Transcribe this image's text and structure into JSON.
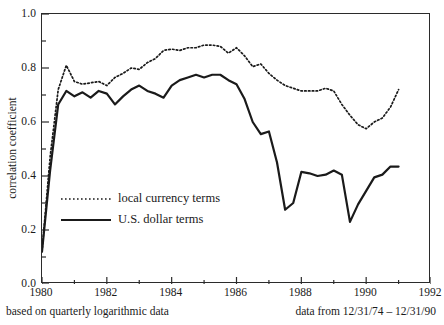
{
  "chart_data": {
    "type": "line",
    "title": "",
    "xlabel": "",
    "ylabel": "correlation coefficient",
    "xlim": [
      1980,
      1992
    ],
    "ylim": [
      0.0,
      1.0
    ],
    "grid": false,
    "legend_position": "inside-left-middle",
    "x_ticks": [
      "1980",
      "1982",
      "1984",
      "1986",
      "1988",
      "1990",
      "1992"
    ],
    "x_tick_values": [
      1980,
      1982,
      1984,
      1986,
      1988,
      1990,
      1992
    ],
    "x_minor_step": 1,
    "y_ticks": [
      "0.0",
      "0.2",
      "0.4",
      "0.6",
      "0.8",
      "1.0"
    ],
    "y_tick_values": [
      0.0,
      0.2,
      0.4,
      0.6,
      0.8,
      1.0
    ],
    "y_minor_step": 0.1,
    "x": [
      1980.0,
      1980.25,
      1980.5,
      1980.75,
      1981.0,
      1981.25,
      1981.5,
      1981.75,
      1982.0,
      1982.25,
      1982.5,
      1982.75,
      1983.0,
      1983.25,
      1983.5,
      1983.75,
      1984.0,
      1984.25,
      1984.5,
      1984.75,
      1985.0,
      1985.25,
      1985.5,
      1985.75,
      1986.0,
      1986.25,
      1986.5,
      1986.75,
      1987.0,
      1987.25,
      1987.5,
      1987.75,
      1988.0,
      1988.25,
      1988.5,
      1988.75,
      1989.0,
      1989.25,
      1989.5,
      1989.75,
      1990.0,
      1990.25,
      1990.5,
      1990.75,
      1991.0
    ],
    "series": [
      {
        "name": "local currency terms",
        "style": "dotted",
        "color": "#1a1a1a",
        "values": [
          0.12,
          0.47,
          0.72,
          0.81,
          0.75,
          0.74,
          0.745,
          0.75,
          0.735,
          0.765,
          0.78,
          0.8,
          0.795,
          0.82,
          0.835,
          0.865,
          0.87,
          0.865,
          0.875,
          0.875,
          0.885,
          0.885,
          0.88,
          0.855,
          0.875,
          0.845,
          0.805,
          0.815,
          0.78,
          0.755,
          0.735,
          0.725,
          0.715,
          0.715,
          0.715,
          0.725,
          0.715,
          0.665,
          0.625,
          0.59,
          0.575,
          0.6,
          0.615,
          0.655,
          0.72
        ]
      },
      {
        "name": "U.S. dollar terms",
        "style": "solid",
        "color": "#1a1a1a",
        "values": [
          0.12,
          0.42,
          0.665,
          0.715,
          0.695,
          0.71,
          0.69,
          0.715,
          0.705,
          0.665,
          0.695,
          0.72,
          0.735,
          0.715,
          0.705,
          0.69,
          0.735,
          0.755,
          0.765,
          0.775,
          0.765,
          0.775,
          0.775,
          0.755,
          0.74,
          0.685,
          0.6,
          0.555,
          0.565,
          0.45,
          0.275,
          0.3,
          0.415,
          0.41,
          0.4,
          0.405,
          0.42,
          0.405,
          0.23,
          0.295,
          0.345,
          0.395,
          0.405,
          0.435,
          0.435
        ]
      }
    ]
  },
  "axes": {
    "y_title": "correlation coefficient"
  },
  "legend": {
    "items": [
      {
        "label": "local currency terms",
        "key": "dotted-line-key"
      },
      {
        "label": "U.S. dollar terms",
        "key": "solid-line-key"
      }
    ]
  },
  "captions": {
    "left": "based on quarterly logarithmic data",
    "right": "data from 12/31/74 – 12/31/90"
  },
  "colors": {
    "line": "#1a1a1a",
    "frame": "#2b2b2b",
    "background": "#ffffff"
  }
}
